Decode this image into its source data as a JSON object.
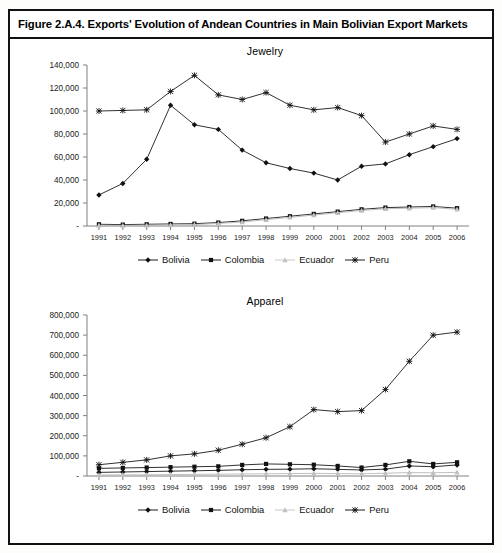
{
  "figure": {
    "caption": "Figure 2.A.4. Exports' Evolution of Andean Countries in Main Bolivian Export Markets"
  },
  "legend": {
    "items": [
      {
        "label": "Bolivia",
        "marker": "diamond",
        "color": "#1a1a1a"
      },
      {
        "label": "Colombia",
        "marker": "square",
        "color": "#1a1a1a"
      },
      {
        "label": "Ecuador",
        "marker": "triangle",
        "color": "#c0c0c0"
      },
      {
        "label": "Peru",
        "marker": "cross",
        "color": "#1a1a1a"
      }
    ]
  },
  "chart_data": [
    {
      "id": "jewelry",
      "type": "line",
      "title": "Jewelry",
      "xlabel": "",
      "ylabel": "",
      "grid": false,
      "legend_position": "bottom",
      "categories": [
        "1991",
        "1992",
        "1993",
        "1994",
        "1995",
        "1996",
        "1997",
        "1998",
        "1999",
        "2000",
        "2001",
        "2002",
        "2003",
        "2004",
        "2005",
        "2006"
      ],
      "ylim": [
        0,
        140000
      ],
      "yticks": [
        0,
        20000,
        40000,
        60000,
        80000,
        100000,
        120000,
        140000
      ],
      "ytick_labels": [
        "-",
        "20,000",
        "40,000",
        "60,000",
        "80,000",
        "100,000",
        "120,000",
        "140,000"
      ],
      "series": [
        {
          "name": "Bolivia",
          "marker": "diamond",
          "color": "#1a1a1a",
          "values": [
            27000,
            37000,
            58000,
            105000,
            88000,
            84000,
            66000,
            55000,
            50000,
            46000,
            40000,
            52000,
            54000,
            62000,
            69000,
            76000
          ]
        },
        {
          "name": "Colombia",
          "marker": "square",
          "color": "#1a1a1a",
          "values": [
            1500,
            1200,
            1500,
            1800,
            2000,
            3000,
            4500,
            6500,
            8500,
            10500,
            12500,
            14500,
            16000,
            16500,
            17000,
            15500
          ]
        },
        {
          "name": "Ecuador",
          "marker": "triangle",
          "color": "#c0c0c0",
          "values": [
            600,
            500,
            700,
            900,
            1200,
            2200,
            3500,
            5500,
            7500,
            9500,
            11500,
            13500,
            15000,
            15500,
            16000,
            14500
          ]
        },
        {
          "name": "Peru",
          "marker": "cross",
          "color": "#1a1a1a",
          "values": [
            100000,
            100500,
            101000,
            117000,
            131000,
            114000,
            110000,
            116000,
            105000,
            101000,
            103000,
            96000,
            73000,
            80000,
            87000,
            84000
          ]
        }
      ]
    },
    {
      "id": "apparel",
      "type": "line",
      "title": "Apparel",
      "xlabel": "",
      "ylabel": "",
      "grid": false,
      "legend_position": "bottom",
      "categories": [
        "1991",
        "1992",
        "1993",
        "1994",
        "1995",
        "1996",
        "1997",
        "1998",
        "1999",
        "2000",
        "2001",
        "2002",
        "2003",
        "2004",
        "2005",
        "2006"
      ],
      "ylim": [
        0,
        800000
      ],
      "yticks": [
        0,
        100000,
        200000,
        300000,
        400000,
        500000,
        600000,
        700000,
        800000
      ],
      "ytick_labels": [
        "-",
        "100,000",
        "200,000",
        "300,000",
        "400,000",
        "500,000",
        "600,000",
        "700,000",
        "800,000"
      ],
      "series": [
        {
          "name": "Bolivia",
          "marker": "diamond",
          "color": "#1a1a1a",
          "values": [
            18000,
            20000,
            22000,
            24000,
            26000,
            28000,
            31000,
            33000,
            34000,
            36000,
            33000,
            30000,
            34000,
            50000,
            46000,
            55000
          ]
        },
        {
          "name": "Colombia",
          "marker": "square",
          "color": "#1a1a1a",
          "values": [
            38000,
            40000,
            42000,
            44000,
            46000,
            48000,
            55000,
            60000,
            58000,
            56000,
            50000,
            42000,
            55000,
            73000,
            60000,
            68000
          ]
        },
        {
          "name": "Ecuador",
          "marker": "triangle",
          "color": "#c0c0c0",
          "values": [
            5000,
            5500,
            6000,
            7000,
            8000,
            9000,
            10000,
            11000,
            12000,
            13000,
            12000,
            11000,
            14000,
            17000,
            16000,
            18000
          ]
        },
        {
          "name": "Peru",
          "marker": "cross",
          "color": "#1a1a1a",
          "values": [
            56000,
            68000,
            80000,
            100000,
            110000,
            128000,
            158000,
            190000,
            245000,
            330000,
            320000,
            325000,
            430000,
            570000,
            700000,
            715000
          ]
        }
      ]
    }
  ]
}
